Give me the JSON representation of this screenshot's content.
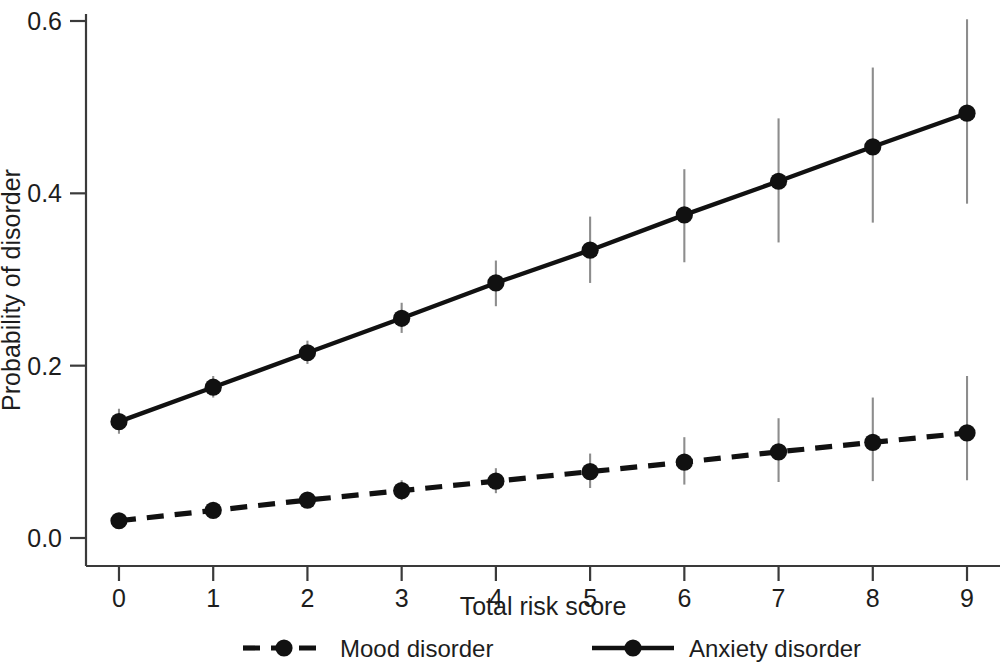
{
  "chart_data": {
    "type": "line",
    "title": "",
    "subtitle": "",
    "xlabel": "Total risk score",
    "ylabel": "Probability of disorder",
    "x": [
      0,
      1,
      2,
      3,
      4,
      5,
      6,
      7,
      8,
      9
    ],
    "xticklabels": [
      "0",
      "1",
      "2",
      "3",
      "4",
      "5",
      "6",
      "7",
      "8",
      "9"
    ],
    "yticks": [
      0.0,
      0.2,
      0.4,
      0.6
    ],
    "yticklabels": [
      "0.0",
      "0.2",
      "0.4",
      "0.6"
    ],
    "xlim": [
      -0.35,
      9.35
    ],
    "ylim": [
      0.0,
      0.62
    ],
    "grid": false,
    "legend_position": "below-axes",
    "error_bars": "95% confidence interval (vertical, no caps)",
    "series": [
      {
        "name": "Mood disorder",
        "linestyle": "dashed",
        "marker": "filled-circle",
        "color": "#111111",
        "values": [
          0.02,
          0.032,
          0.044,
          0.055,
          0.066,
          0.077,
          0.088,
          0.1,
          0.111,
          0.122
        ],
        "ci_low": [
          0.014,
          0.025,
          0.036,
          0.044,
          0.052,
          0.058,
          0.062,
          0.065,
          0.066,
          0.067
        ],
        "ci_high": [
          0.027,
          0.04,
          0.053,
          0.067,
          0.081,
          0.098,
          0.117,
          0.139,
          0.163,
          0.188
        ]
      },
      {
        "name": "Anxiety disorder",
        "linestyle": "solid",
        "marker": "filled-circle",
        "color": "#111111",
        "values": [
          0.135,
          0.175,
          0.215,
          0.255,
          0.296,
          0.334,
          0.375,
          0.414,
          0.454,
          0.493
        ],
        "ci_low": [
          0.121,
          0.163,
          0.202,
          0.238,
          0.269,
          0.296,
          0.32,
          0.343,
          0.366,
          0.388
        ],
        "ci_high": [
          0.15,
          0.188,
          0.229,
          0.273,
          0.322,
          0.373,
          0.428,
          0.487,
          0.546,
          0.602
        ]
      }
    ]
  },
  "axes": {
    "y_axis_label": "Probability of disorder",
    "x_axis_label": "Total risk score"
  },
  "legend": {
    "items": [
      {
        "label": "Mood disorder",
        "style": "dashed"
      },
      {
        "label": "Anxiety disorder",
        "style": "solid"
      }
    ]
  }
}
